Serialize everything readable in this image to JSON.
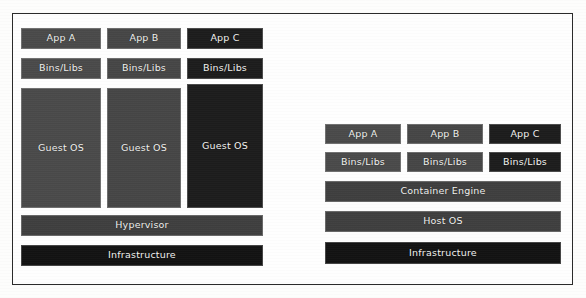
{
  "diagram": {
    "background_color": "#fdfdfc",
    "frame_color": "#2b2b2b",
    "text_color": "#f2f2f0"
  },
  "vm_stack": {
    "name": "Virtual Machine architecture",
    "apps": [
      {
        "label": "App A",
        "tone": "#4a4a4a"
      },
      {
        "label": "App B",
        "tone": "#464646"
      },
      {
        "label": "App C",
        "tone": "#1c1c1c"
      }
    ],
    "bins": [
      {
        "label": "Bins/Libs",
        "tone": "#4a4a4a"
      },
      {
        "label": "Bins/Libs",
        "tone": "#464646"
      },
      {
        "label": "Bins/Libs",
        "tone": "#1c1c1c"
      }
    ],
    "guests": [
      {
        "label": "Guest OS",
        "tone": "#4a4a4a"
      },
      {
        "label": "Guest OS",
        "tone": "#464646"
      },
      {
        "label": "Guest OS",
        "tone": "#1c1c1c"
      }
    ],
    "hypervisor": {
      "label": "Hypervisor",
      "tone": "#3f3f3f"
    },
    "infrastructure": {
      "label": "Infrastructure",
      "tone": "#121212"
    }
  },
  "container_stack": {
    "name": "Container architecture",
    "apps": [
      {
        "label": "App A",
        "tone": "#4a4a4a"
      },
      {
        "label": "App B",
        "tone": "#464646"
      },
      {
        "label": "App C",
        "tone": "#1c1c1c"
      }
    ],
    "bins": [
      {
        "label": "Bins/Libs",
        "tone": "#4a4a4a"
      },
      {
        "label": "Bins/Libs",
        "tone": "#464646"
      },
      {
        "label": "Bins/Libs",
        "tone": "#1c1c1c"
      }
    ],
    "container_engine": {
      "label": "Container Engine",
      "tone": "#3f3f3f"
    },
    "host_os": {
      "label": "Host OS",
      "tone": "#3f3f3f"
    },
    "infrastructure": {
      "label": "Infrastructure",
      "tone": "#121212"
    }
  }
}
